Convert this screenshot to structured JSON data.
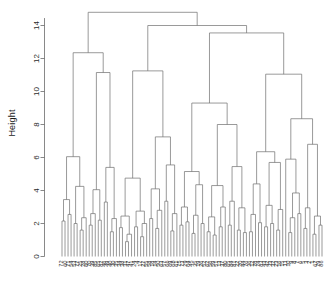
{
  "chart_data": {
    "type": "dendrogram",
    "title": "",
    "xlabel": "",
    "ylabel": "Height",
    "ylim": [
      0,
      15
    ],
    "yticks": [
      0,
      2,
      4,
      6,
      8,
      10,
      12,
      14
    ],
    "ytick_labels": [
      "0",
      "2",
      "4",
      "6",
      "8",
      "10",
      "12",
      "14"
    ],
    "grid": false,
    "legend": null,
    "axis_color": "#6b6b6b",
    "link_color": "#6e6e6e",
    "label_color": "#2b2b2b",
    "n_leaves": 88,
    "leaf_labels": [
      "72",
      "60",
      "71",
      "54",
      "53",
      "77",
      "25",
      "28",
      "60",
      "70",
      "39",
      "85",
      "65",
      "82",
      "46",
      "49",
      "40",
      "30",
      "35",
      "34",
      "38",
      "31",
      "47",
      "41",
      "24",
      "4",
      "17",
      "27",
      "55",
      "58",
      "18",
      "14",
      "50",
      "63",
      "57",
      "66",
      "69",
      "68",
      "61",
      "75",
      "73",
      "29",
      "64",
      "45",
      "35",
      "19",
      "26",
      "52",
      "62",
      "56",
      "59",
      "51",
      "13",
      "37",
      "80",
      "65",
      "84",
      "81",
      "22",
      "20",
      "44",
      "76",
      "36",
      "12",
      "78",
      "74",
      "83",
      "43",
      "42",
      "33",
      "32",
      "23",
      "16",
      "15",
      "11",
      "10",
      "9",
      "8",
      "7",
      "6",
      "5",
      "3",
      "2",
      "1",
      "67",
      "79",
      "86",
      "87"
    ],
    "merges": [
      {
        "h": 3.45,
        "note": "leftmost pair"
      },
      {
        "h": 4.25,
        "note": "left subcluster"
      },
      {
        "h": 6.05,
        "note": "left cluster A"
      },
      {
        "h": 4.05,
        "note": "left cluster B base"
      },
      {
        "h": 5.4,
        "note": "60/70 pair join"
      },
      {
        "h": 11.15,
        "note": "left cluster B"
      },
      {
        "h": 12.35,
        "note": "left main cluster"
      },
      {
        "h": 4.75,
        "note": "mid-left group"
      },
      {
        "h": 7.25,
        "note": "mid group with 25/26"
      },
      {
        "h": 11.25,
        "note": "second major cluster"
      },
      {
        "h": 5.15,
        "note": "mid-right subgroup"
      },
      {
        "h": 4.3,
        "note": "mid-right base"
      },
      {
        "h": 8.0,
        "note": "mid-right cluster"
      },
      {
        "h": 9.3,
        "note": "third cluster"
      },
      {
        "h": 5.45,
        "note": "right-mid group"
      },
      {
        "h": 4.4,
        "note": "right group base"
      },
      {
        "h": 6.35,
        "note": "right cluster A"
      },
      {
        "h": 5.7,
        "note": "right cluster B"
      },
      {
        "h": 11.05,
        "note": "right main cluster"
      },
      {
        "h": 5.9,
        "note": "leaf 21 join"
      },
      {
        "h": 6.8,
        "note": "far right pair"
      },
      {
        "h": 8.35,
        "note": "far right cluster"
      },
      {
        "h": 13.55,
        "note": "right half root"
      },
      {
        "h": 14.0,
        "note": "upper join"
      },
      {
        "h": 14.8,
        "note": "root"
      }
    ],
    "notable_labels": [
      "72",
      "60",
      "71",
      "53",
      "77",
      "28",
      "60",
      "70",
      "25",
      "26",
      "21",
      "19",
      "38",
      "84",
      "82",
      "17",
      "12",
      "36",
      "44",
      "63",
      "60",
      "78"
    ]
  },
  "axes": {
    "y_title": "Height",
    "tick_0": "0",
    "tick_2": "2",
    "tick_4": "4",
    "tick_6": "6",
    "tick_8": "8",
    "tick_10": "10",
    "tick_12": "12",
    "tick_14": "14"
  }
}
